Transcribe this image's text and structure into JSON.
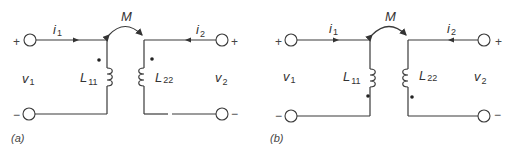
{
  "figure": {
    "panels": [
      {
        "id": "a",
        "caption": "(a)",
        "mutual_label": "M",
        "current1": {
          "sym": "i",
          "sub": "1"
        },
        "current2": {
          "sym": "i",
          "sub": "2"
        },
        "voltage1": {
          "sym": "v",
          "sub": "1"
        },
        "voltage2": {
          "sym": "v",
          "sub": "2"
        },
        "inductor1": {
          "sym": "L",
          "sub": "11"
        },
        "inductor2": {
          "sym": "L",
          "sub": "22"
        },
        "plus": "+",
        "minus": "−",
        "dot_position": "top"
      },
      {
        "id": "b",
        "caption": "(b)",
        "mutual_label": "M",
        "current1": {
          "sym": "i",
          "sub": "1"
        },
        "current2": {
          "sym": "i",
          "sub": "2"
        },
        "voltage1": {
          "sym": "v",
          "sub": "1"
        },
        "voltage2": {
          "sym": "v",
          "sub": "2"
        },
        "inductor1": {
          "sym": "L",
          "sub": "11"
        },
        "inductor2": {
          "sym": "L",
          "sub": "22"
        },
        "plus": "+",
        "minus": "−",
        "dot_position": "bottom"
      }
    ]
  }
}
